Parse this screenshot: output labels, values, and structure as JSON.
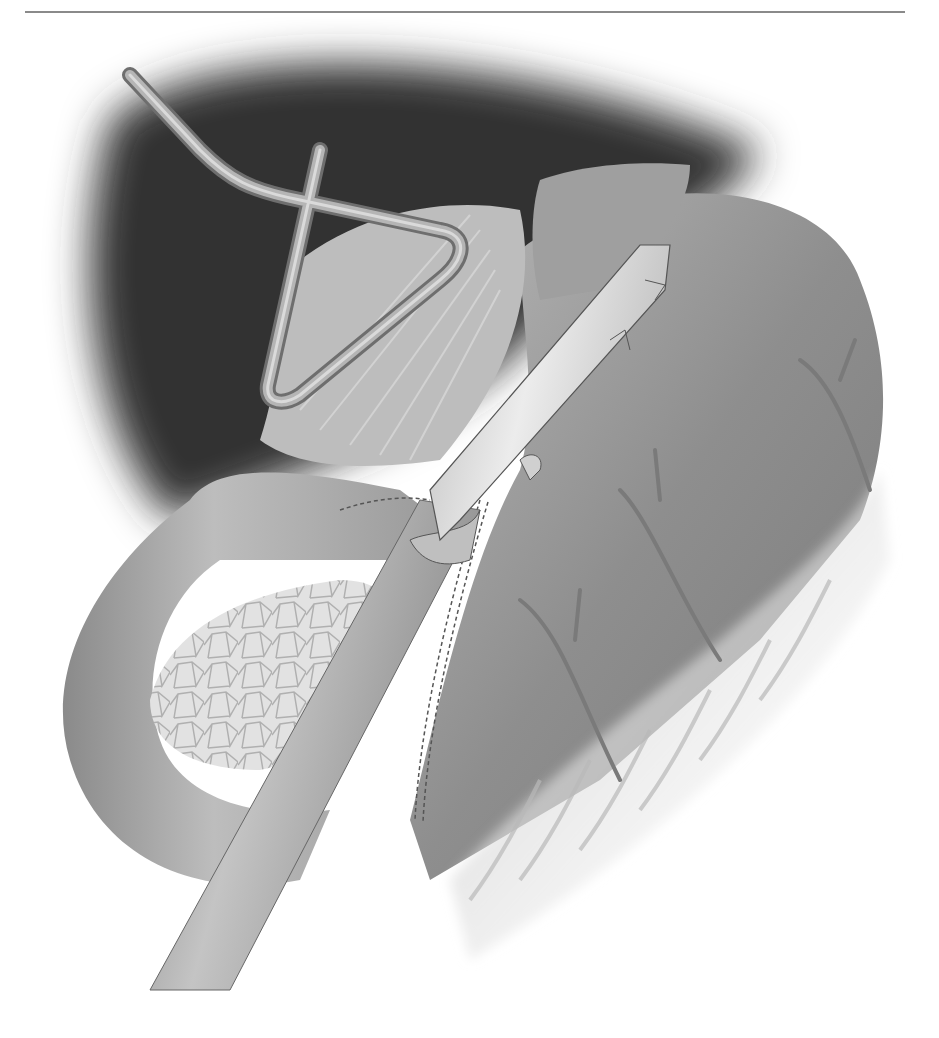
{
  "figure": {
    "type": "medical-illustration",
    "style": "grayscale",
    "elements": [
      {
        "name": "horizontal-rule",
        "desc": "thin gray top rule"
      },
      {
        "name": "liver-retractor",
        "desc": "bent wire triangular retractor"
      },
      {
        "name": "dark-liver-shadow",
        "desc": "dark background liver region"
      },
      {
        "name": "esophagus",
        "desc": "tubular esophagus at top center"
      },
      {
        "name": "gastric-fundus",
        "desc": "stomach body on right"
      },
      {
        "name": "duodenum-loop",
        "desc": "curved bowel loop on left"
      },
      {
        "name": "pancreas",
        "desc": "lobulated textured organ within loop"
      },
      {
        "name": "linear-stapler",
        "desc": "long cylindrical instrument with jaw"
      },
      {
        "name": "staple-line",
        "desc": "dashed staple rows along cut edge"
      },
      {
        "name": "gastroepiploic-vessels",
        "desc": "branching vessels over omentum"
      },
      {
        "name": "omentum",
        "desc": "fringed fatty tissue along greater curvature"
      }
    ]
  },
  "colors": {
    "background": "#ffffff",
    "rule": "#8a8a8a",
    "liver_dark": "#3a3a3a",
    "tissue_mid": "#9a9a9a",
    "tissue_light": "#c8c8c8",
    "instrument": "#d8d8d8",
    "outline": "#555555"
  }
}
